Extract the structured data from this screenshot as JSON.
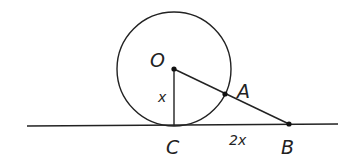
{
  "diagram": {
    "type": "geometry",
    "colors": {
      "stroke": "#222222",
      "background": "#ffffff"
    },
    "points": {
      "O": {
        "label": "O",
        "x": 174,
        "y": 69
      },
      "A": {
        "label": "A",
        "x": 225,
        "y": 94
      },
      "B": {
        "label": "B",
        "x": 289,
        "y": 124
      },
      "C": {
        "label": "C",
        "x": 174,
        "y": 126
      }
    },
    "circle": {
      "center": "O",
      "radius": 57
    },
    "tangent_line": {
      "x1": 27,
      "y1": 126,
      "x2": 338,
      "y2": 124
    },
    "segments": [
      {
        "from": "O",
        "to": "C",
        "label": "x"
      },
      {
        "from": "C",
        "to": "B",
        "label": "2x"
      },
      {
        "from": "O",
        "to": "B",
        "label": ""
      }
    ],
    "labels": {
      "O": "O",
      "A": "A",
      "B": "B",
      "C": "C",
      "OC": "x",
      "CB": "2x"
    }
  }
}
